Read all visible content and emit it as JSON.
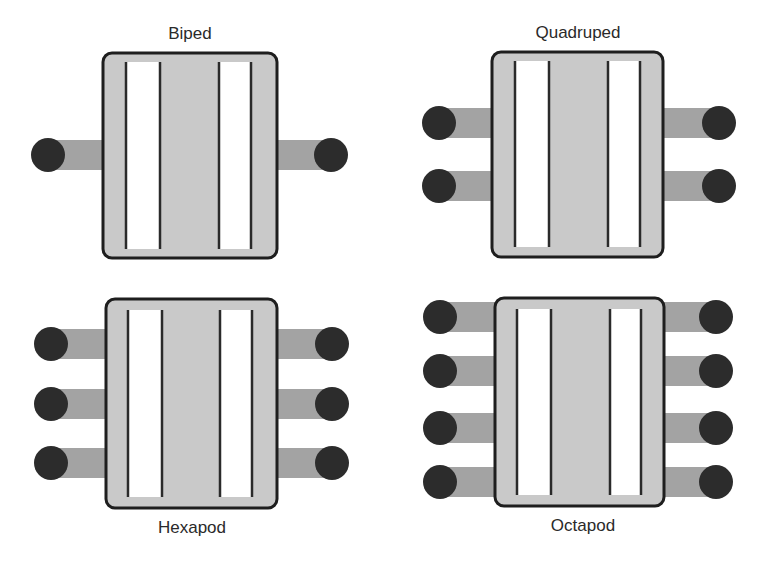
{
  "colors": {
    "body_fill": "#c9c9c9",
    "body_stroke": "#1e1e1e",
    "strip_fill": "#ffffff",
    "strip_line": "#2a2a2a",
    "axle": "#a3a3a3",
    "wheel": "#2c2c2c"
  },
  "robots": [
    {
      "id": "biped",
      "label": "Biped",
      "legs_per_side": 1
    },
    {
      "id": "quadruped",
      "label": "Quadruped",
      "legs_per_side": 2
    },
    {
      "id": "hexapod",
      "label": "Hexapod",
      "legs_per_side": 3
    },
    {
      "id": "octapod",
      "label": "Octapod",
      "legs_per_side": 4
    }
  ]
}
